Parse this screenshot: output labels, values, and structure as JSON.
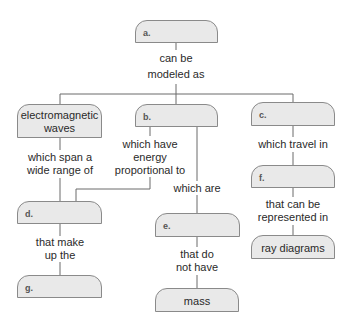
{
  "diagram": {
    "type": "concept-map",
    "colors": {
      "node_fill": "#e9e9e9",
      "node_border": "#8a8a8a",
      "line": "#6b6b6b",
      "text": "#2a2a2a"
    },
    "nodes": {
      "a": {
        "label": "a.",
        "filled": false
      },
      "electromagnetic_waves": {
        "label": "electromagnetic waves",
        "line1": "electromagnetic",
        "line2": "waves",
        "filled": true
      },
      "b": {
        "label": "b.",
        "filled": false
      },
      "c": {
        "label": "c.",
        "filled": false
      },
      "d": {
        "label": "d.",
        "filled": false
      },
      "e": {
        "label": "e.",
        "filled": false
      },
      "f": {
        "label": "f.",
        "filled": false
      },
      "g": {
        "label": "g.",
        "filled": false
      },
      "ray_diagrams": {
        "label": "ray diagrams",
        "filled": true
      },
      "mass": {
        "label": "mass",
        "filled": true
      }
    },
    "links": {
      "a_to_row": {
        "line1": "can be",
        "line2": "modeled as"
      },
      "em_to_d": {
        "line1": "which span a",
        "line2": "wide range of"
      },
      "b_to_d": {
        "line1": "which have",
        "line2": "energy",
        "line3": "proportional to"
      },
      "b_to_e": {
        "line1": "which are"
      },
      "c_to_f": {
        "line1": "which travel in"
      },
      "d_to_g": {
        "line1": "that make",
        "line2": "up the"
      },
      "e_to_mass": {
        "line1": "that do",
        "line2": "not have"
      },
      "f_to_ray": {
        "line1": "that can be",
        "line2": "represented in"
      }
    },
    "edges": [
      {
        "from": "a",
        "to": "electromagnetic_waves",
        "label": "can be modeled as"
      },
      {
        "from": "a",
        "to": "b",
        "label": "can be modeled as"
      },
      {
        "from": "a",
        "to": "c",
        "label": "can be modeled as"
      },
      {
        "from": "electromagnetic_waves",
        "to": "d",
        "label": "which span a wide range of"
      },
      {
        "from": "b",
        "to": "d",
        "label": "which have energy proportional to"
      },
      {
        "from": "b",
        "to": "e",
        "label": "which are"
      },
      {
        "from": "c",
        "to": "f",
        "label": "which travel in"
      },
      {
        "from": "d",
        "to": "g",
        "label": "that make up the"
      },
      {
        "from": "e",
        "to": "mass",
        "label": "that do not have"
      },
      {
        "from": "f",
        "to": "ray_diagrams",
        "label": "that can be represented in"
      }
    ]
  }
}
